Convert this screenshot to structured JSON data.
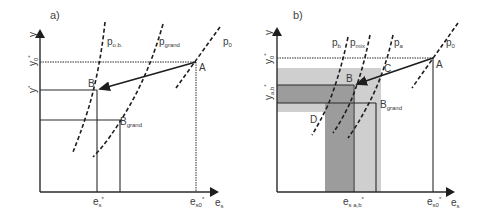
{
  "panel_a": {
    "label": "a)",
    "axis_y": "y",
    "axis_x": "e",
    "axis_x_sub": "s",
    "y_ticks": [
      {
        "main": "y",
        "sub": "0",
        "sup": "*"
      },
      {
        "main": "y",
        "sub": "",
        "sup": "*"
      }
    ],
    "x_ticks": [
      {
        "main": "e",
        "sub": "s",
        "sup": "*"
      },
      {
        "main": "e",
        "sub": "s0",
        "sup": "*"
      }
    ],
    "curves": [
      {
        "main": "p",
        "sub": "o.b."
      },
      {
        "main": "p",
        "sub": "grand"
      },
      {
        "main": "p",
        "sub": "0"
      }
    ],
    "points": [
      {
        "main": "A",
        "sub": ""
      },
      {
        "main": "B",
        "sub": ""
      },
      {
        "main": "B",
        "sub": "grand"
      }
    ]
  },
  "panel_b": {
    "label": "b)",
    "axis_y": "y",
    "axis_x": "e",
    "axis_x_sub": "s",
    "y_ticks": [
      {
        "main": "y",
        "sub": "0",
        "sup": "*"
      },
      {
        "main": "y",
        "sub": "a,b",
        "sup": "*"
      }
    ],
    "x_ticks": [
      {
        "main": "e",
        "sub": "s a,b",
        "sup": "*"
      },
      {
        "main": "e",
        "sub": "s0",
        "sup": "*"
      }
    ],
    "curves": [
      {
        "main": "p",
        "sub": "b"
      },
      {
        "main": "p",
        "sub": "mix"
      },
      {
        "main": "p",
        "sub": "a"
      },
      {
        "main": "p",
        "sub": "0"
      }
    ],
    "points": [
      {
        "main": "A",
        "sub": ""
      },
      {
        "main": "B",
        "sub": ""
      },
      {
        "main": "C",
        "sub": ""
      },
      {
        "main": "D",
        "sub": ""
      },
      {
        "main": "B",
        "sub": "grand"
      }
    ],
    "colors": {
      "light_shade": "#c8c8c8",
      "dark_shade": "#9a9a9a"
    }
  }
}
